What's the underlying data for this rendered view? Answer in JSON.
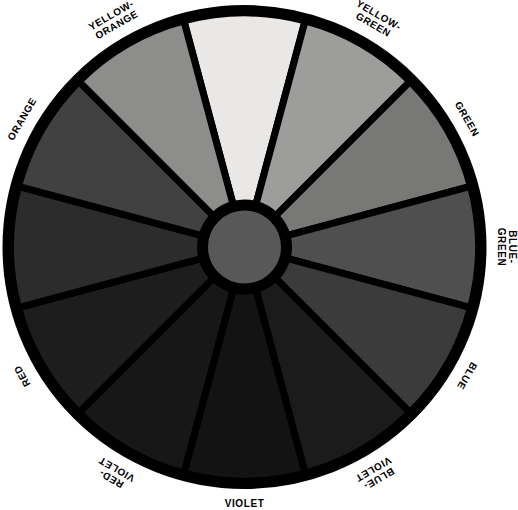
{
  "figure": {
    "name": "color-wheel",
    "background": "#ffffff",
    "outline_color": "#000000",
    "segment_count": 12,
    "hub": {
      "label": "center-hub",
      "fill": "#585858"
    }
  },
  "chart_data": {
    "type": "pie",
    "title": "",
    "subtitle": "",
    "xlabel": "",
    "ylabel": "",
    "legend_position": "around-rim",
    "grid": false,
    "equal_slices": true,
    "slice_degrees": 30,
    "categories": [
      "YELLOW",
      "YELLOW-\nGREEN",
      "GREEN",
      "BLUE-\nGREEN",
      "BLUE",
      "BLUE-\nVIOLET",
      "VIOLET",
      "RED-\nVIOLET",
      "RED",
      "ORANGE",
      "ORANGE",
      "YELLOW-\nORANGE"
    ],
    "values": [
      30,
      30,
      30,
      30,
      30,
      30,
      30,
      30,
      30,
      30,
      30,
      30
    ],
    "colors": [
      "#e9e8e6",
      "#9d9d9b",
      "#787877",
      "#4f4f4f",
      "#3b3b3b",
      "#1b1b1b",
      "#131313",
      "#171717",
      "#1d1d1d",
      "#2c2c2c",
      "#414141",
      "#8d8d8b"
    ]
  },
  "segments": [
    {
      "id": "yellow",
      "label": "YELLOW",
      "fill": "#e9e8e6",
      "start_angle": -15,
      "end_angle": 15,
      "label_angle": 0,
      "label_rotation": 0,
      "label_lines": [
        "YELLOW"
      ]
    },
    {
      "id": "yellow-green",
      "label": "YELLOW-GREEN",
      "fill": "#9d9d9b",
      "start_angle": 15,
      "end_angle": 45,
      "label_angle": 30,
      "label_rotation": 30,
      "label_lines": [
        "YELLOW-",
        "GREEN"
      ]
    },
    {
      "id": "green",
      "label": "GREEN",
      "fill": "#787877",
      "start_angle": 45,
      "end_angle": 75,
      "label_angle": 60,
      "label_rotation": 60,
      "label_lines": [
        "GREEN"
      ]
    },
    {
      "id": "blue-green",
      "label": "BLUE-GREEN",
      "fill": "#4f4f4f",
      "start_angle": 75,
      "end_angle": 105,
      "label_angle": 90,
      "label_rotation": 90,
      "label_lines": [
        "BLUE-",
        "GREEN"
      ]
    },
    {
      "id": "blue",
      "label": "BLUE",
      "fill": "#3b3b3b",
      "start_angle": 105,
      "end_angle": 135,
      "label_angle": 120,
      "label_rotation": 120,
      "label_lines": [
        "BLUE"
      ]
    },
    {
      "id": "blue-violet",
      "label": "BLUE-VIOLET",
      "fill": "#1b1b1b",
      "start_angle": 135,
      "end_angle": 165,
      "label_angle": 150,
      "label_rotation": 150,
      "label_lines": [
        "BLUE-",
        "VIOLET"
      ]
    },
    {
      "id": "violet",
      "label": "VIOLET",
      "fill": "#131313",
      "start_angle": 165,
      "end_angle": 195,
      "label_angle": 180,
      "label_rotation": 0,
      "label_lines": [
        "VIOLET"
      ]
    },
    {
      "id": "red-violet",
      "label": "RED-VIOLET",
      "fill": "#171717",
      "start_angle": 195,
      "end_angle": 225,
      "label_angle": 210,
      "label_rotation": -150,
      "label_lines": [
        "RED-",
        "VIOLET"
      ]
    },
    {
      "id": "red",
      "label": "RED",
      "fill": "#1d1d1d",
      "start_angle": 225,
      "end_angle": 255,
      "label_angle": 240,
      "label_rotation": -120,
      "label_lines": [
        "RED"
      ]
    },
    {
      "id": "orange-lower",
      "label": "ORANGE",
      "fill": "#2c2c2c",
      "start_angle": 255,
      "end_angle": 285,
      "label_angle": 270,
      "label_rotation": -90,
      "label_lines": [
        "ORANGE"
      ]
    },
    {
      "id": "orange-upper",
      "label": "ORANGE",
      "fill": "#414141",
      "start_angle": 285,
      "end_angle": 315,
      "label_angle": 300,
      "label_rotation": -60,
      "label_lines": [
        "ORANGE"
      ]
    },
    {
      "id": "yellow-orange",
      "label": "YELLOW-ORANGE",
      "fill": "#8d8d8b",
      "start_angle": 315,
      "end_angle": 345,
      "label_angle": 330,
      "label_rotation": -30,
      "label_lines": [
        "YELLOW-",
        "ORANGE"
      ]
    }
  ]
}
